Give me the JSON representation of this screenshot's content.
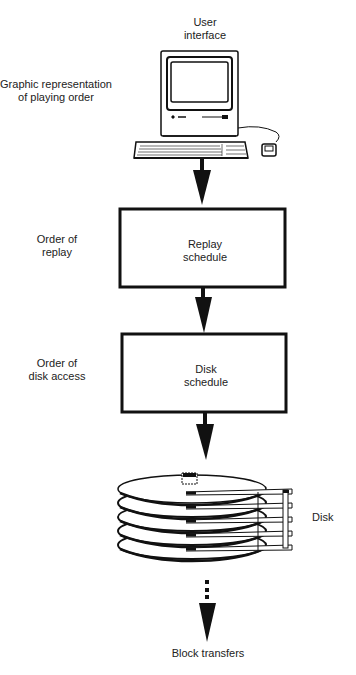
{
  "diagram": {
    "top_label": [
      "User",
      "interface"
    ],
    "left_labels": {
      "ui": [
        "Graphic representation",
        "of playing order"
      ],
      "replay": [
        "Order of",
        "replay"
      ],
      "disk": [
        "Order of",
        "disk access"
      ]
    },
    "boxes": {
      "replay": [
        "Replay",
        "schedule"
      ],
      "disk": [
        "Disk",
        "schedule"
      ]
    },
    "disk_label": "Disk",
    "bottom_label": "Block transfers"
  }
}
